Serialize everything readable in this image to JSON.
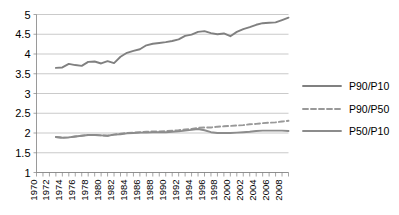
{
  "chart_data": {
    "type": "line",
    "title": "",
    "subtitle": "",
    "xlabel": "",
    "ylabel": "",
    "xlim": [
      1970,
      2009
    ],
    "ylim": [
      1,
      5
    ],
    "grid": true,
    "legend_position": "right",
    "y_ticks": [
      "1",
      "1.5",
      "2",
      "2.5",
      "3",
      "3.5",
      "4",
      "4.5",
      "5"
    ],
    "y_tick_values": [
      1,
      1.5,
      2,
      2.5,
      3,
      3.5,
      4,
      4.5,
      5
    ],
    "x_ticks": [
      "1970",
      "1972",
      "1974",
      "1976",
      "1978",
      "1980",
      "1982",
      "1984",
      "1986",
      "1988",
      "1990",
      "1992",
      "1994",
      "1996",
      "1998",
      "2000",
      "2002",
      "2004",
      "2006",
      "2008"
    ],
    "x_tick_values": [
      1970,
      1972,
      1974,
      1976,
      1978,
      1980,
      1982,
      1984,
      1986,
      1988,
      1990,
      1992,
      1994,
      1996,
      1998,
      2000,
      2002,
      2004,
      2006,
      2008
    ],
    "x": [
      1973,
      1974,
      1975,
      1976,
      1977,
      1978,
      1979,
      1980,
      1981,
      1982,
      1983,
      1984,
      1985,
      1986,
      1987,
      1988,
      1989,
      1990,
      1991,
      1992,
      1993,
      1994,
      1995,
      1996,
      1997,
      1998,
      1999,
      2000,
      2001,
      2002,
      2003,
      2004,
      2005,
      2006,
      2007,
      2008,
      2009
    ],
    "series": [
      {
        "name": "P90/P10",
        "style": "solid",
        "color": "#808080",
        "values": [
          3.65,
          3.66,
          3.75,
          3.72,
          3.7,
          3.8,
          3.81,
          3.76,
          3.82,
          3.77,
          3.93,
          4.03,
          4.08,
          4.12,
          4.22,
          4.26,
          4.28,
          4.3,
          4.33,
          4.37,
          4.46,
          4.49,
          4.56,
          4.58,
          4.53,
          4.5,
          4.52,
          4.45,
          4.56,
          4.63,
          4.68,
          4.74,
          4.78,
          4.79,
          4.8,
          4.86,
          4.92
        ]
      },
      {
        "name": "P90/P50",
        "style": "dashed",
        "color": "#999999",
        "values": [
          1.9,
          1.88,
          1.89,
          1.91,
          1.93,
          1.95,
          1.95,
          1.94,
          1.93,
          1.96,
          1.98,
          2.0,
          2.01,
          2.02,
          2.03,
          2.04,
          2.04,
          2.05,
          2.06,
          2.07,
          2.09,
          2.1,
          2.13,
          2.14,
          2.14,
          2.16,
          2.17,
          2.18,
          2.19,
          2.2,
          2.22,
          2.23,
          2.25,
          2.26,
          2.27,
          2.29,
          2.31
        ]
      },
      {
        "name": "P50/P10",
        "style": "solid",
        "color": "#8c8c8c",
        "values": [
          1.9,
          1.88,
          1.89,
          1.91,
          1.93,
          1.95,
          1.95,
          1.94,
          1.93,
          1.96,
          1.97,
          1.99,
          2.0,
          2.01,
          2.01,
          2.02,
          2.02,
          2.02,
          2.03,
          2.04,
          2.06,
          2.08,
          2.1,
          2.07,
          2.02,
          2.0,
          2.0,
          2.0,
          2.01,
          2.02,
          2.03,
          2.05,
          2.06,
          2.06,
          2.06,
          2.06,
          2.05
        ]
      }
    ]
  }
}
